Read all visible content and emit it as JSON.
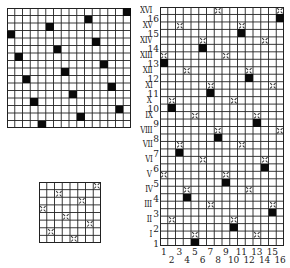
{
  "figure": {
    "panels": [
      {
        "id": "top-left-grid",
        "rows": 16,
        "cols": 16,
        "box": {
          "x": 7,
          "y": 8,
          "w": 124,
          "h": 120
        },
        "marks": [
          {
            "row": 0,
            "col": 15,
            "type": "black"
          },
          {
            "row": 1,
            "col": 10,
            "type": "black"
          },
          {
            "row": 2,
            "col": 5,
            "type": "black"
          },
          {
            "row": 3,
            "col": 0,
            "type": "black"
          },
          {
            "row": 4,
            "col": 11,
            "type": "black"
          },
          {
            "row": 5,
            "col": 6,
            "type": "black"
          },
          {
            "row": 6,
            "col": 1,
            "type": "black"
          },
          {
            "row": 7,
            "col": 12,
            "type": "black"
          },
          {
            "row": 8,
            "col": 7,
            "type": "black"
          },
          {
            "row": 9,
            "col": 2,
            "type": "black"
          },
          {
            "row": 10,
            "col": 13,
            "type": "black"
          },
          {
            "row": 11,
            "col": 8,
            "type": "black"
          },
          {
            "row": 12,
            "col": 3,
            "type": "black"
          },
          {
            "row": 13,
            "col": 14,
            "type": "black"
          },
          {
            "row": 14,
            "col": 9,
            "type": "black"
          },
          {
            "row": 15,
            "col": 4,
            "type": "black"
          }
        ]
      },
      {
        "id": "bottom-left-grid",
        "rows": 8,
        "cols": 8,
        "box": {
          "x": 39,
          "y": 182,
          "w": 62,
          "h": 61
        },
        "marks": [
          {
            "row": 0,
            "col": 7,
            "type": "cross"
          },
          {
            "row": 1,
            "col": 2,
            "type": "cross"
          },
          {
            "row": 2,
            "col": 5,
            "type": "cross"
          },
          {
            "row": 3,
            "col": 0,
            "type": "cross"
          },
          {
            "row": 4,
            "col": 3,
            "type": "cross"
          },
          {
            "row": 5,
            "col": 6,
            "type": "cross"
          },
          {
            "row": 6,
            "col": 1,
            "type": "cross"
          },
          {
            "row": 7,
            "col": 4,
            "type": "cross"
          }
        ]
      },
      {
        "id": "right-grid",
        "rows": 32,
        "cols": 16,
        "box": {
          "x": 160,
          "y": 7,
          "w": 124,
          "h": 239
        },
        "marks": [
          {
            "row": 0,
            "col": 7,
            "type": "cross"
          },
          {
            "row": 0,
            "col": 15,
            "type": "cross"
          },
          {
            "row": 1,
            "col": 15,
            "type": "black"
          },
          {
            "row": 2,
            "col": 2,
            "type": "cross"
          },
          {
            "row": 2,
            "col": 10,
            "type": "cross"
          },
          {
            "row": 3,
            "col": 10,
            "type": "black"
          },
          {
            "row": 4,
            "col": 5,
            "type": "cross"
          },
          {
            "row": 4,
            "col": 13,
            "type": "cross"
          },
          {
            "row": 5,
            "col": 5,
            "type": "black"
          },
          {
            "row": 6,
            "col": 0,
            "type": "cross"
          },
          {
            "row": 6,
            "col": 8,
            "type": "cross"
          },
          {
            "row": 7,
            "col": 0,
            "type": "black"
          },
          {
            "row": 8,
            "col": 3,
            "type": "cross"
          },
          {
            "row": 8,
            "col": 11,
            "type": "cross"
          },
          {
            "row": 9,
            "col": 11,
            "type": "black"
          },
          {
            "row": 10,
            "col": 6,
            "type": "cross"
          },
          {
            "row": 10,
            "col": 14,
            "type": "cross"
          },
          {
            "row": 11,
            "col": 6,
            "type": "black"
          },
          {
            "row": 12,
            "col": 1,
            "type": "cross"
          },
          {
            "row": 12,
            "col": 9,
            "type": "cross"
          },
          {
            "row": 13,
            "col": 1,
            "type": "black"
          },
          {
            "row": 14,
            "col": 4,
            "type": "cross"
          },
          {
            "row": 14,
            "col": 12,
            "type": "cross"
          },
          {
            "row": 15,
            "col": 12,
            "type": "black"
          },
          {
            "row": 16,
            "col": 7,
            "type": "cross"
          },
          {
            "row": 16,
            "col": 15,
            "type": "cross"
          },
          {
            "row": 17,
            "col": 7,
            "type": "black"
          },
          {
            "row": 18,
            "col": 2,
            "type": "cross"
          },
          {
            "row": 18,
            "col": 10,
            "type": "cross"
          },
          {
            "row": 19,
            "col": 2,
            "type": "black"
          },
          {
            "row": 20,
            "col": 5,
            "type": "cross"
          },
          {
            "row": 20,
            "col": 13,
            "type": "cross"
          },
          {
            "row": 21,
            "col": 13,
            "type": "black"
          },
          {
            "row": 22,
            "col": 0,
            "type": "cross"
          },
          {
            "row": 22,
            "col": 8,
            "type": "cross"
          },
          {
            "row": 23,
            "col": 8,
            "type": "black"
          },
          {
            "row": 24,
            "col": 3,
            "type": "cross"
          },
          {
            "row": 24,
            "col": 11,
            "type": "cross"
          },
          {
            "row": 25,
            "col": 3,
            "type": "black"
          },
          {
            "row": 26,
            "col": 6,
            "type": "cross"
          },
          {
            "row": 26,
            "col": 14,
            "type": "cross"
          },
          {
            "row": 27,
            "col": 14,
            "type": "black"
          },
          {
            "row": 28,
            "col": 1,
            "type": "cross"
          },
          {
            "row": 28,
            "col": 9,
            "type": "cross"
          },
          {
            "row": 29,
            "col": 9,
            "type": "black"
          },
          {
            "row": 30,
            "col": 4,
            "type": "cross"
          },
          {
            "row": 30,
            "col": 12,
            "type": "cross"
          },
          {
            "row": 31,
            "col": 4,
            "type": "black"
          }
        ],
        "row_labels_roman": [
          "XVI",
          "XV",
          "XIV",
          "XIII",
          "XII",
          "XI",
          "X",
          "IX",
          "VIII",
          "VII",
          "VI",
          "V",
          "IV",
          "III",
          "II",
          "I"
        ],
        "row_labels_arabic": [
          "16",
          "15",
          "14",
          "13",
          "12",
          "11",
          "10",
          "9",
          "8",
          "7",
          "6",
          "5",
          "4",
          "3",
          "2",
          "1"
        ],
        "col_labels_odd": [
          "1",
          "3",
          "5",
          "7",
          "9",
          "11",
          "13",
          "15"
        ],
        "col_labels_even": [
          "2",
          "4",
          "6",
          "8",
          "10",
          "12",
          "14",
          "16"
        ]
      }
    ],
    "colors": {
      "line": "#222222",
      "fill": "#0a0a0a",
      "background": "#ffffff"
    }
  }
}
